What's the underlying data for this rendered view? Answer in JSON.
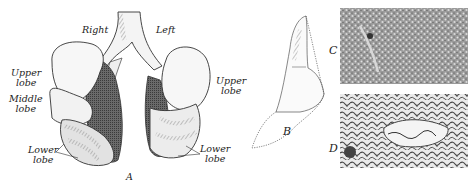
{
  "figure": {
    "panel_a": {
      "letter": "A",
      "labels": {
        "right": "Right",
        "left": "Left",
        "upper_lobe_right": [
          "Upper",
          "lobe"
        ],
        "middle_lobe": [
          "Middle",
          "lobe"
        ],
        "lower_lobe_right": [
          "Lower",
          "lobe"
        ],
        "upper_lobe_left": [
          "Upper",
          "lobe"
        ],
        "lower_lobe_left": [
          "Lower",
          "lobe"
        ]
      }
    },
    "panel_b": {
      "letter": "B"
    },
    "panel_c": {
      "letter": "C"
    },
    "panel_d": {
      "letter": "D"
    }
  }
}
